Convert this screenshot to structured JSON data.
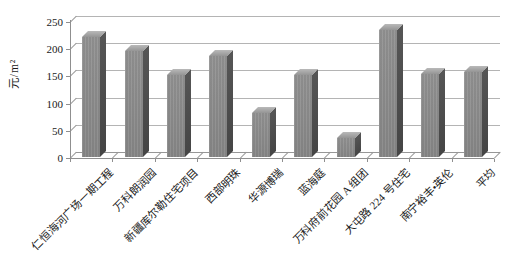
{
  "chart_data": {
    "type": "bar",
    "style": "3d-column",
    "title": "",
    "xlabel": "",
    "ylabel": "元/m²",
    "categories": [
      "仁恒海河广场一期工程",
      "万科朗润园",
      "新疆库尔勒住宅项目",
      "西部明珠",
      "华源博瑞",
      "蓝海庭",
      "万科府前花园 A 组团",
      "大屯路 224 号住宅",
      "南宁裕丰•英伦",
      "平均"
    ],
    "values": [
      220,
      195,
      150,
      185,
      80,
      151,
      35,
      233,
      152,
      157
    ],
    "yticks": [
      0,
      50,
      100,
      150,
      200,
      250
    ],
    "ylim": [
      0,
      250
    ],
    "grid": true,
    "legend": false,
    "colors": {
      "bar_front": "#8b8b8b",
      "bar_side": "#4d4d4d",
      "bar_top": "#a6a6a6",
      "gridline": "#b4b4b4",
      "axis": "#8f8f8f",
      "text": "#1a1a1a",
      "background": "#ffffff"
    }
  }
}
